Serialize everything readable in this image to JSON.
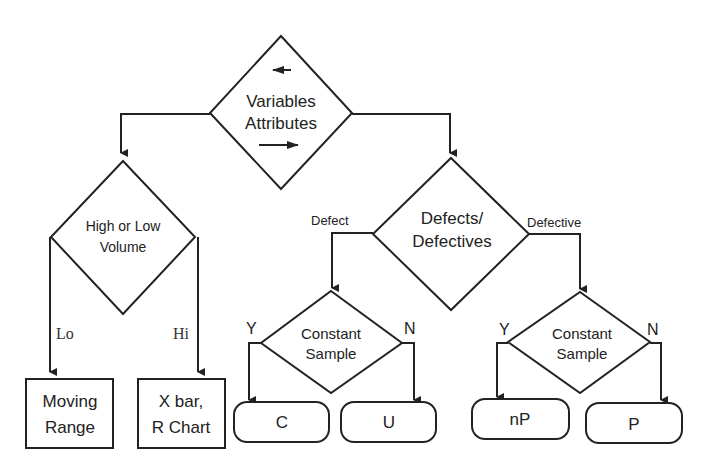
{
  "diagram": {
    "type": "flowchart",
    "nodes": {
      "root": {
        "line1": "Variables",
        "line2": "Attributes",
        "shape": "diamond"
      },
      "volume": {
        "line1": "High or Low",
        "line2": "Volume",
        "shape": "diamond"
      },
      "defects": {
        "line1": "Defects/",
        "line2": "Defectives",
        "shape": "diamond"
      },
      "const_left": {
        "line1": "Constant",
        "line2": "Sample",
        "shape": "diamond"
      },
      "const_right": {
        "line1": "Constant",
        "line2": "Sample",
        "shape": "diamond"
      },
      "moving_range": {
        "line1": "Moving",
        "line2": "Range",
        "shape": "rectangle"
      },
      "xbar": {
        "line1": "X bar,",
        "line2": "R Chart",
        "shape": "rectangle"
      },
      "c": {
        "label": "C",
        "shape": "rounded"
      },
      "u": {
        "label": "U",
        "shape": "rounded"
      },
      "np": {
        "label": "nP",
        "shape": "rounded"
      },
      "p": {
        "label": "P",
        "shape": "rounded"
      }
    },
    "edge_labels": {
      "lo": "Lo",
      "hi": "Hi",
      "defect": "Defect",
      "defective": "Defective",
      "left_yes": "Y",
      "left_no": "N",
      "right_yes": "Y",
      "right_no": "N"
    },
    "edges": [
      {
        "from": "root",
        "to": "volume",
        "via": "left (Variables)"
      },
      {
        "from": "root",
        "to": "defects",
        "via": "right (Attributes)"
      },
      {
        "from": "volume",
        "to": "moving_range",
        "label": "Lo"
      },
      {
        "from": "volume",
        "to": "xbar",
        "label": "Hi"
      },
      {
        "from": "defects",
        "to": "const_left",
        "label": "Defect"
      },
      {
        "from": "defects",
        "to": "const_right",
        "label": "Defective"
      },
      {
        "from": "const_left",
        "to": "c",
        "label": "Y"
      },
      {
        "from": "const_left",
        "to": "u",
        "label": "N"
      },
      {
        "from": "const_right",
        "to": "np",
        "label": "Y"
      },
      {
        "from": "const_right",
        "to": "p",
        "label": "N"
      }
    ],
    "colors": {
      "line": "#222222",
      "background": "#ffffff"
    }
  }
}
